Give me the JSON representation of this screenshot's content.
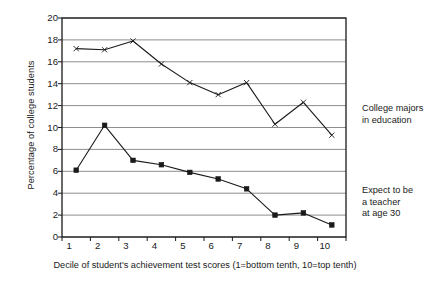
{
  "chart_data": {
    "type": "line",
    "title": "",
    "xlabel": "Decile of student's achievement test scores (1=bottom tenth, 10=top tenth)",
    "ylabel": "Percentage of college students",
    "categories": [
      "1",
      "2",
      "3",
      "4",
      "5",
      "6",
      "7",
      "8",
      "9",
      "10"
    ],
    "ylim": [
      0,
      20
    ],
    "yticks": [
      0,
      2,
      4,
      6,
      8,
      10,
      12,
      14,
      16,
      18,
      20
    ],
    "grid": "horizontal",
    "legend_position": "right-inline-annotations",
    "series": [
      {
        "name": "College majors in education",
        "marker": "cross",
        "values": [
          17.2,
          17.1,
          17.9,
          15.8,
          14.1,
          13.0,
          14.1,
          10.3,
          12.3,
          9.3
        ]
      },
      {
        "name": "Expect to be a teacher at age 30",
        "marker": "square",
        "values": [
          6.1,
          10.2,
          7.0,
          6.6,
          5.9,
          5.3,
          4.4,
          2.0,
          2.2,
          1.1
        ]
      }
    ],
    "annotations": [
      {
        "text": "College majors\nin education",
        "line1": "College majors",
        "line2": "in education"
      },
      {
        "text": "Expect to be a teacher at age 30",
        "line1": "Expect to be",
        "line2": "a teacher",
        "line3": "at age 30"
      }
    ],
    "colors": {
      "line": "#1a1a1a",
      "grid": "#808080",
      "axis": "#1a1a1a",
      "background": "#ffffff"
    }
  }
}
